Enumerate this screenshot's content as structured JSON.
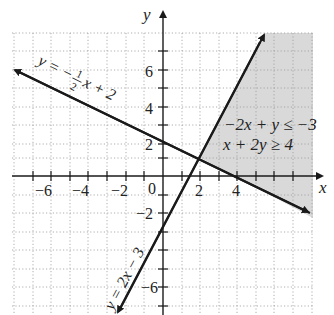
{
  "graph": {
    "x_axis_label": "x",
    "y_axis_label": "y",
    "origin_label": "0",
    "x_tick_labels": [
      {
        "value": -6,
        "text": "−6"
      },
      {
        "value": -4,
        "text": "−4"
      },
      {
        "value": -2,
        "text": "−2"
      },
      {
        "value": 2,
        "text": "2"
      },
      {
        "value": 4,
        "text": "4"
      }
    ],
    "y_tick_labels": [
      {
        "value": 6,
        "text": "6"
      },
      {
        "value": 4,
        "text": "4"
      },
      {
        "value": 2,
        "text": "2"
      },
      {
        "value": -2,
        "text": "−2"
      },
      {
        "value": -6,
        "text": "−6"
      }
    ],
    "x_range": [
      -8,
      8
    ],
    "y_range": [
      -8,
      8
    ],
    "grid": "dotted",
    "lines": [
      {
        "equation_label": "y = −½x + 2",
        "slope": -0.5,
        "intercept": 2
      },
      {
        "equation_label": "y = 2x − 3",
        "slope": 2,
        "intercept": -3
      }
    ],
    "system_label": {
      "line1": "−2x + y ≤ −3",
      "line2": "x + 2y ≥ 4"
    },
    "shaded_region": "intersection of x + 2y ≥ 4 and −2x + y ≤ −3 (right of y=2x−3, above y=−½x+2)",
    "vertex": {
      "x": 2,
      "y": 1
    },
    "shade_color": "#d9d9d9",
    "line_color": "#1a1a1a"
  },
  "text": {
    "line1_y": "y",
    "line1_eq": "=",
    "line1_minus": "−",
    "line1_num": "1",
    "line1_den": "2",
    "line1_rest": "x + 2",
    "line2": "y = 2x − 3",
    "ineq1": "−2x + y ≤ −3",
    "ineq2": "x + 2y ≥ 4"
  }
}
